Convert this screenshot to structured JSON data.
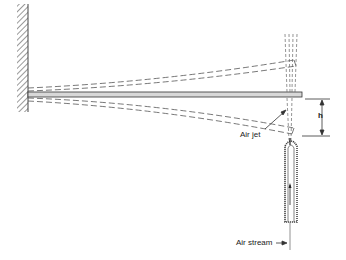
{
  "diagram": {
    "type": "cantilever beam deflection with air jet",
    "labels": {
      "air_jet": "Air jet",
      "air_stream": "Air stream",
      "height": "h"
    },
    "elements": [
      "fixed wall",
      "cantilever beam",
      "deflected beam positions (dashed)",
      "air nozzle tube",
      "height dimension h"
    ],
    "colors": {
      "line": "#333333",
      "beam_fill": "#d8d8d8",
      "background": "#ffffff"
    }
  }
}
